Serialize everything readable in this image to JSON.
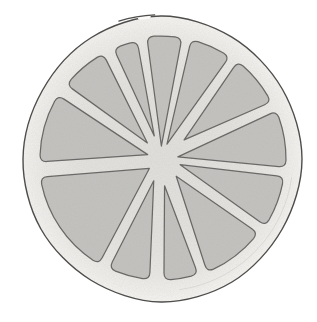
{
  "meta": {
    "style": "pencil/ink sketch with gray stipple shading on white background",
    "segment_count": 12
  },
  "canvas": {
    "width": 317,
    "height": 322,
    "background": "#ffffff"
  },
  "colors": {
    "background": "#ffffff",
    "outline_stroke": "#4e4d4b",
    "segment_stroke": "#646361",
    "segment_fill": "#c4c3c0",
    "pith_center": "#e2e1dd",
    "pith_mid": "#e5e4e0",
    "pith_outer": "#ebeae6",
    "pith_rim": "#f2f1ee",
    "pith_edge": "#f8f7f4",
    "inner_shadow_line": "#d6d5d2",
    "gap_cover": "#fbfaf8"
  },
  "fruit": {
    "center": {
      "x": 161,
      "y": 159
    },
    "outline": {
      "angles_deg": [
        0,
        30,
        60,
        90,
        120,
        150,
        180,
        210,
        240,
        270,
        300,
        330
      ],
      "radii": [
        141,
        140,
        142,
        143,
        140,
        139,
        138,
        137,
        140,
        143,
        141,
        140
      ],
      "stroke_width": 1.4,
      "sketch_break": {
        "gap_start_deg": 261.5,
        "gap_end_deg": 265,
        "stub_start_deg": 253,
        "stub_end_deg": 267.5,
        "stub_radius": 144.2
      }
    },
    "pith_gradient_stops": [
      [
        0,
        "#e2e1dd"
      ],
      [
        0.55,
        "#e5e4e0"
      ],
      [
        0.8,
        "#ebeae6"
      ],
      [
        0.92,
        "#f2f1ee"
      ],
      [
        1,
        "#f8f7f4"
      ]
    ],
    "inner_shadow_arc": {
      "radius": 132,
      "start_deg": 8,
      "end_deg": 82,
      "stroke_width": 1,
      "opacity": 0.8
    },
    "segment_style": {
      "corner_radius": 7,
      "stroke_width": 1.25
    },
    "segments": [
      {
        "name": "wedge-11-oclock-narrow",
        "a0": 246.8,
        "a1": 258.6,
        "apex_r": 24,
        "outer_r": 120,
        "skew": 1
      },
      {
        "name": "wedge-12-oclock",
        "a0": 263.4,
        "a1": 279.8,
        "apex_r": 13,
        "outer_r": 123,
        "skew": 0
      },
      {
        "name": "wedge-1-oclock",
        "a0": 284.2,
        "a1": 303.8,
        "apex_r": 16,
        "outer_r": 123,
        "skew": -2
      },
      {
        "name": "wedge-2-oclock",
        "a0": 308.2,
        "a1": 332.6,
        "apex_r": 30,
        "outer_r": 124,
        "skew": 0
      },
      {
        "name": "wedge-3-oclock",
        "a0": 337.4,
        "a1": 363.8,
        "apex_r": 17,
        "outer_r": 125,
        "skew": 2
      },
      {
        "name": "wedge-4-oclock",
        "a0": 8.2,
        "a1": 32.6,
        "apex_r": 20,
        "outer_r": 124,
        "skew": -4
      },
      {
        "name": "wedge-4-50-oclock",
        "a0": 37.4,
        "a1": 67.8,
        "apex_r": 23,
        "outer_r": 122,
        "skew": -4
      },
      {
        "name": "wedge-5-oclock-sliver",
        "a0": 72.2,
        "a1": 88.6,
        "apex_r": 27,
        "outer_r": 121,
        "skew": 2
      },
      {
        "name": "wedge-6-30-oclock",
        "a0": 95.4,
        "a1": 115.4,
        "apex_r": 23,
        "outer_r": 121,
        "skew": 3
      },
      {
        "name": "wedge-8-oclock-wide",
        "a0": 120.6,
        "a1": 171.4,
        "apex_r": 15,
        "outer_r": 122,
        "skew": -5
      },
      {
        "name": "wedge-9-oclock",
        "a0": 178.6,
        "a1": 211.8,
        "apex_r": 14,
        "outer_r": 121,
        "skew": 3
      },
      {
        "name": "wedge-10-oclock",
        "a0": 218.2,
        "a1": 241.2,
        "apex_r": 21,
        "outer_r": 120,
        "skew": 0
      }
    ],
    "grain": {
      "base_frequency": 0.9,
      "gray": 0.35,
      "alpha": 0.18
    }
  }
}
